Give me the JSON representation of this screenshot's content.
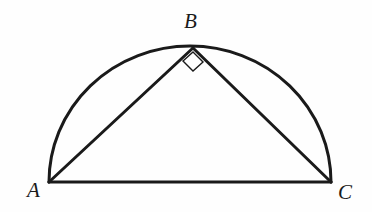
{
  "figure": {
    "kind": "geometry-diagram",
    "background_color": "#fefefe",
    "stroke_color": "#1a1a1a"
  },
  "labels": {
    "a": "A",
    "b": "B",
    "c": "C"
  },
  "geometry": {
    "points": {
      "A": {
        "x": 49,
        "y": 182
      },
      "B": {
        "x": 193,
        "y": 47
      },
      "C": {
        "x": 331,
        "y": 182
      }
    },
    "semicircle": {
      "center_x": 190,
      "center_y": 182,
      "radius_x": 141,
      "radius_y": 136,
      "stroke_width": 3
    },
    "segments": [
      {
        "name": "AC",
        "from": "A",
        "to": "C",
        "stroke_width": 3
      },
      {
        "name": "AB",
        "from": "A",
        "to": "B",
        "stroke_width": 3
      },
      {
        "name": "BC",
        "from": "B",
        "to": "C",
        "stroke_width": 3
      }
    ],
    "right_angle_marker": {
      "at": "B",
      "shape": "diamond",
      "points": "193,52 203,62 193,71 183,61",
      "stroke_width": 1.4
    }
  }
}
